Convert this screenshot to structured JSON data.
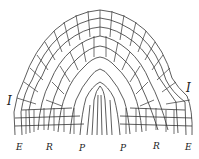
{
  "diagram": {
    "type": "cellular tissue section (apical meristem)",
    "side_labels": [
      {
        "id": "left",
        "text": "I"
      },
      {
        "id": "right",
        "text": "I"
      }
    ],
    "bottom_labels": [
      {
        "id": "e-left",
        "text": "E"
      },
      {
        "id": "r-left",
        "text": "R"
      },
      {
        "id": "p-left",
        "text": "P"
      },
      {
        "id": "p-right",
        "text": "P"
      },
      {
        "id": "r-right",
        "text": "R"
      },
      {
        "id": "e-right",
        "text": "E"
      }
    ],
    "colors": {
      "line": "#333333",
      "background": "#ffffff"
    }
  }
}
